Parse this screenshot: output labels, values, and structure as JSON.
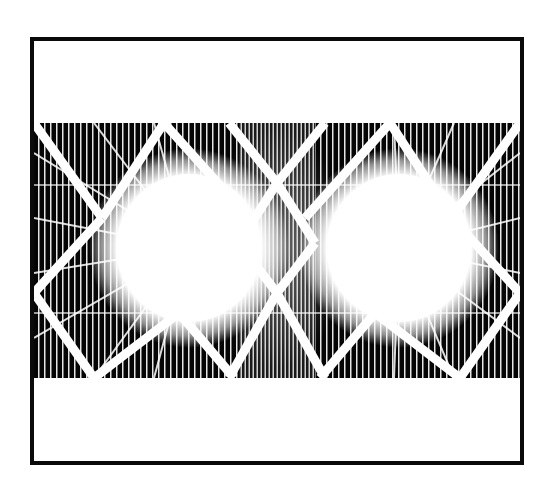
{
  "artwork": {
    "description": "Black and white lattice truss pattern with two glowing white radial bursts",
    "colors": {
      "frame": "#0a0a0a",
      "background": "#ffffff",
      "band": "#050505",
      "lattice": "#ffffff"
    },
    "frame": {
      "x": 30,
      "y": 37,
      "width": 492,
      "height": 426,
      "border": 4
    },
    "band": {
      "x": 34,
      "y": 123,
      "width": 486,
      "height": 255
    },
    "bursts": [
      {
        "cx": 155,
        "cy": 125,
        "rx": 88,
        "ry": 90
      },
      {
        "cx": 365,
        "cy": 125,
        "rx": 88,
        "ry": 90
      }
    ]
  }
}
